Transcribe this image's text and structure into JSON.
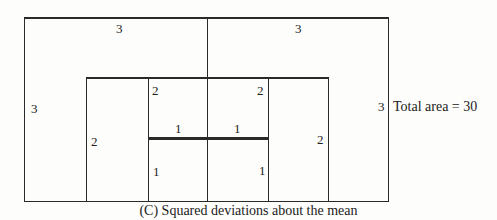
{
  "diagram": {
    "labels": {
      "outer_top_left": "3",
      "outer_top_right": "3",
      "outer_left": "3",
      "outer_right": "3",
      "mid_left": "2",
      "mid_right": "2",
      "mid_top_left": "2",
      "mid_top_right": "2",
      "inner_top_left": "1",
      "inner_top_right": "1",
      "inner_left": "1",
      "inner_right": "1"
    },
    "total_area": "Total area = 30",
    "caption": "(C)  Squared deviations about the mean"
  }
}
